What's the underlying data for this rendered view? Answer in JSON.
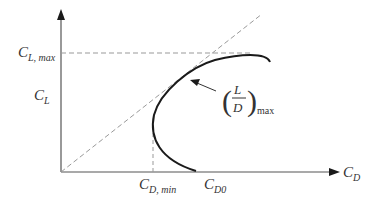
{
  "diagram": {
    "type": "drag-polar",
    "axes": {
      "x_label_main": "C",
      "x_label_sub": "D",
      "y_label_main": "C",
      "y_label_sub": "L"
    },
    "annotations": {
      "cl_max_main": "C",
      "cl_max_sub": "L, max",
      "cd_min_main": "C",
      "cd_min_sub": "D, min",
      "cd0_main": "C",
      "cd0_sub": "D0",
      "ld_max_numerator": "L",
      "ld_max_denominator": "D",
      "ld_max_sub": "max"
    },
    "colors": {
      "axis": "#555555",
      "curve": "#1a1a1a",
      "dashed": "#999999",
      "text": "#333333"
    }
  }
}
